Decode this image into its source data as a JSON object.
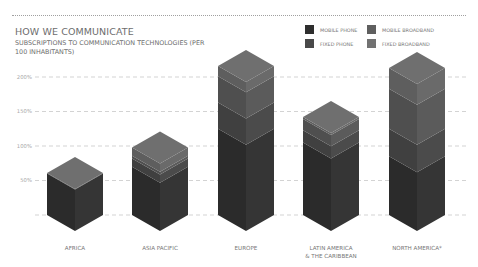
{
  "header": {
    "title": "HOW WE COMMUNICATE",
    "subtitle": "SUBSCRIPTIONS TO COMMUNICATION TECHNOLOGIES (PER 100 INHABITANTS)"
  },
  "legend": [
    {
      "label": "MOBILE PHONE",
      "color": "#2e2e2e"
    },
    {
      "label": "MOBILE BROADBAND",
      "color": "#5f5f5f"
    },
    {
      "label": "FIXED PHONE",
      "color": "#494949"
    },
    {
      "label": "FIXED BROADBAND",
      "color": "#727272"
    }
  ],
  "chart_data": {
    "type": "bar",
    "stacked": true,
    "style": "isometric 3D stacked columns",
    "title": "HOW WE COMMUNICATE",
    "subtitle": "SUBSCRIPTIONS TO COMMUNICATION TECHNOLOGIES (PER 100 INHABITANTS)",
    "xlabel": "",
    "ylabel": "",
    "categories": [
      "AFRICA",
      "ASIA PACIFIC",
      "EUROPE",
      "LATIN AMERICA & THE CARIBBEAN",
      "NORTH AMERICA*"
    ],
    "category_labels": [
      [
        "AFRICA"
      ],
      [
        "ASIA PACIFIC"
      ],
      [
        "EUROPE"
      ],
      [
        "LATIN AMERICA",
        "& THE CARIBBEAN"
      ],
      [
        "NORTH AMERICA*"
      ]
    ],
    "series": [
      {
        "name": "MOBILE PHONE",
        "values": [
          60,
          70,
          125,
          105,
          85
        ]
      },
      {
        "name": "FIXED PHONE",
        "values": [
          1,
          12,
          38,
          18,
          40
        ]
      },
      {
        "name": "MOBILE BROADBAND",
        "values": [
          0,
          4,
          38,
          16,
          58
        ]
      },
      {
        "name": "FIXED BROADBAND",
        "values": [
          0,
          12,
          15,
          3,
          30
        ]
      }
    ],
    "totals": [
      61,
      98,
      216,
      142,
      213
    ],
    "yticks": [
      "50%",
      "100%",
      "150%",
      "200%"
    ],
    "ylim": [
      0,
      220
    ],
    "grid": "dashed horizontal",
    "legend_position": "top-right"
  }
}
